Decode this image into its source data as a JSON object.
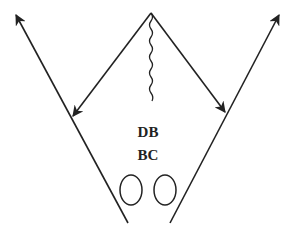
{
  "diagram": {
    "type": "football-play",
    "labels": {
      "position1": "DB",
      "position2": "BC"
    },
    "colors": {
      "stroke": "#222222",
      "background": "#ffffff"
    },
    "elements": [
      {
        "kind": "route-arrow",
        "name": "left-outer-route",
        "from": [
          128,
          223
        ],
        "to": [
          15,
          13
        ]
      },
      {
        "kind": "route-arrow",
        "name": "right-outer-route",
        "from": [
          170,
          223
        ],
        "to": [
          280,
          13
        ]
      },
      {
        "kind": "arrow",
        "name": "left-inner-arrow",
        "from": [
          151,
          13
        ],
        "to": [
          72,
          117
        ]
      },
      {
        "kind": "arrow",
        "name": "right-inner-arrow",
        "from": [
          151,
          13
        ],
        "to": [
          226,
          113
        ]
      },
      {
        "kind": "wavy-line",
        "name": "motion-line",
        "from": [
          151,
          13
        ],
        "to": [
          152,
          101
        ]
      },
      {
        "kind": "oval",
        "name": "player-left",
        "center": [
          131,
          190
        ]
      },
      {
        "kind": "oval",
        "name": "player-right",
        "center": [
          165,
          190
        ]
      }
    ]
  }
}
